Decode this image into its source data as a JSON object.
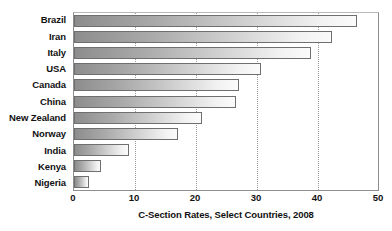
{
  "chart_data": {
    "type": "bar",
    "orientation": "horizontal",
    "title": "C-Section Rates, Select Countries, 2008",
    "xlabel": "C-Section Rates, Select Countries, 2008",
    "ylabel": "",
    "categories": [
      "Brazil",
      "Iran",
      "Italy",
      "USA",
      "Canada",
      "China",
      "New Zealand",
      "Norway",
      "India",
      "Kenya",
      "Nigeria"
    ],
    "values": [
      46.4,
      42.3,
      38.8,
      30.7,
      27.0,
      26.5,
      21.0,
      17.0,
      9.0,
      4.5,
      2.5
    ],
    "xlim": [
      0,
      50
    ],
    "xticks": [
      0,
      10,
      20,
      30,
      40,
      50
    ],
    "xtick_labels": [
      "0",
      "10",
      "20",
      "30",
      "40",
      "50"
    ],
    "grid": "vertical-dotted",
    "legend": null,
    "bar_fill": "gradient-gray-left-dark-to-right-light",
    "bar_border_color": "#6f6f6f",
    "text_color": "#111111",
    "background": "#ffffff"
  }
}
